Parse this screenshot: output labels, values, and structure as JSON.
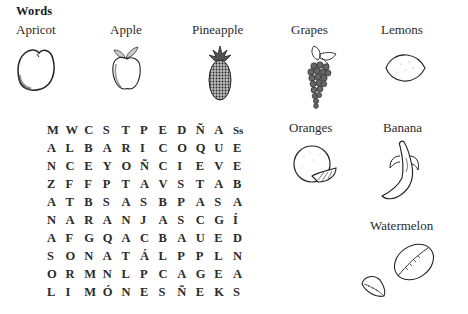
{
  "heading": "Words",
  "words": [
    {
      "label": "Apricot",
      "icon": "apricot-icon"
    },
    {
      "label": "Apple",
      "icon": "apple-icon"
    },
    {
      "label": "Pineapple",
      "icon": "pineapple-icon"
    },
    {
      "label": "Grapes",
      "icon": "grapes-icon"
    },
    {
      "label": "Lemons",
      "icon": "lemon-icon"
    },
    {
      "label": "Oranges",
      "icon": "orange-icon"
    },
    {
      "label": "Banana",
      "icon": "banana-icon"
    },
    {
      "label": "Watermelon",
      "icon": "watermelon-icon"
    }
  ],
  "puzzle": {
    "rows": [
      [
        "M",
        "W",
        "C",
        "S",
        "T",
        "P",
        "E",
        "D",
        "Ñ",
        "A",
        "Ss"
      ],
      [
        "A",
        "L",
        "B",
        "A",
        "R",
        "I",
        "C",
        "O",
        "Q",
        "U",
        "E"
      ],
      [
        "N",
        "C",
        "E",
        "Y",
        "O",
        "Ñ",
        "C",
        "I",
        "E",
        "V",
        "E"
      ],
      [
        "Z",
        "F",
        "F",
        "P",
        "T",
        "A",
        "V",
        "S",
        "T",
        "A",
        "B"
      ],
      [
        "A",
        "T",
        "B",
        "S",
        "A",
        "S",
        "B",
        "P",
        "A",
        "S",
        "A"
      ],
      [
        "N",
        "A",
        "R",
        "A",
        "N",
        "J",
        "A",
        "S",
        "C",
        "G",
        "Í"
      ],
      [
        "A",
        "F",
        "G",
        "Q",
        "A",
        "C",
        "B",
        "A",
        "U",
        "E",
        "D"
      ],
      [
        "S",
        "O",
        "N",
        "A",
        "T",
        "Á",
        "L",
        "P",
        "P",
        "L",
        "N"
      ],
      [
        "O",
        "R",
        "M",
        "N",
        "L",
        "P",
        "C",
        "A",
        "G",
        "E",
        "A"
      ],
      [
        "L",
        "I",
        "M",
        "Ó",
        "N",
        "E",
        "S",
        "Ñ",
        "E",
        "K",
        "S"
      ]
    ]
  }
}
